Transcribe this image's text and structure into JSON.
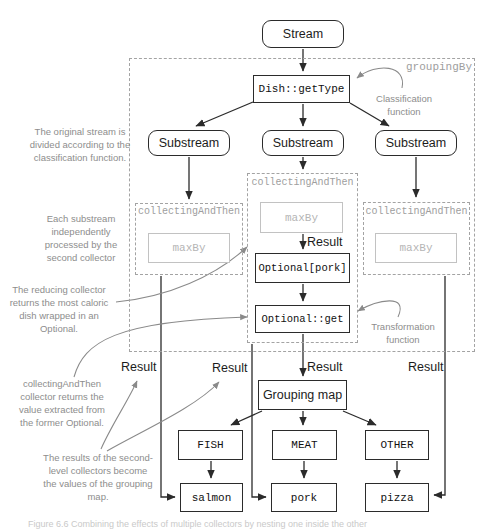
{
  "diagram": {
    "stream": "Stream",
    "grouping_by": "groupingBy",
    "classification_fn": "Dish::getType",
    "classification_note": "Classification function",
    "substreams": [
      "Substream",
      "Substream",
      "Substream"
    ],
    "collectors": [
      {
        "label": "collectingAndThen",
        "inner": "maxBy"
      },
      {
        "label": "collectingAndThen",
        "inner": "maxBy"
      },
      {
        "label": "collectingAndThen",
        "inner": "maxBy"
      }
    ],
    "inner_result": "Result",
    "optional_wrapped": "Optional[pork]",
    "optional_get": "Optional::get",
    "transformation_note": "Transformation function",
    "results": [
      "Result",
      "Result",
      "Result",
      "Result"
    ],
    "grouping_map": "Grouping map",
    "map_entries": [
      {
        "key": "FISH",
        "value": "salmon"
      },
      {
        "key": "MEAT",
        "value": "pork"
      },
      {
        "key": "OTHER",
        "value": "pizza"
      }
    ],
    "annotations": {
      "original_stream": "The original stream is divided according to the classification function.",
      "each_substream": "Each substream independently processed by the second collector",
      "reducing_collector": "The reducing collector returns the most caloric dish wrapped in an Optional.",
      "collecting_and_then": "collectingAndThen collector returns the value extracted from the former Optional.",
      "results_values": "The results of the second-level collectors become the values of the grouping map."
    },
    "caption": "Figure 6.6  Combining the effects of multiple collectors by nesting one inside the other"
  }
}
